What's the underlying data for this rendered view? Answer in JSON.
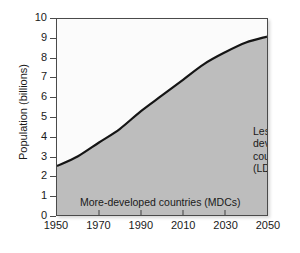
{
  "chart_data": {
    "type": "area",
    "title": "",
    "subtitle": "",
    "xlabel": "",
    "ylabel": "Population (billions)",
    "xlim": [
      1950,
      2050
    ],
    "ylim": [
      0,
      10
    ],
    "grid": false,
    "legend_position": "in-plot annotations",
    "x_ticks": [
      1950,
      1970,
      1990,
      2010,
      2030,
      2050
    ],
    "x_tick_labels": [
      "1950",
      "1970",
      "1990",
      "2010",
      "2030",
      "2050"
    ],
    "y_ticks": [
      0,
      1,
      2,
      3,
      4,
      5,
      6,
      7,
      8,
      9,
      10
    ],
    "y_tick_labels": [
      "0",
      "1",
      "2",
      "3",
      "4",
      "5",
      "6",
      "7",
      "8",
      "9",
      "10"
    ],
    "x": [
      1950,
      1960,
      1970,
      1980,
      1990,
      2000,
      2010,
      2020,
      2030,
      2040,
      2050
    ],
    "series": [
      {
        "name": "Total world population",
        "values": [
          2.5,
          3.0,
          3.7,
          4.4,
          5.3,
          6.1,
          6.9,
          7.7,
          8.3,
          8.8,
          9.1
        ]
      }
    ],
    "annotations": [
      {
        "name": "less-developed-countries",
        "lines": [
          "Less-",
          "developed",
          "countries",
          "(LDCs)"
        ],
        "text": "Less-developed countries (LDCs)",
        "region": "above-curve"
      },
      {
        "name": "more-developed-countries",
        "text": "More-developed countries (MDCs)",
        "region": "below-curve"
      }
    ],
    "colors": {
      "area_fill": "#bdbdbd",
      "upper_fill": "#fbfbfb",
      "curve": "#151515",
      "axis": "#4a4a4a",
      "text": "#1a1a1a"
    }
  },
  "axes": {
    "y_title": "Population (billions)",
    "y_tick_labels": [
      "10",
      "9",
      "8",
      "7",
      "6",
      "5",
      "4",
      "3",
      "2",
      "1",
      "0"
    ],
    "x_tick_labels": [
      "1950",
      "1970",
      "1990",
      "2010",
      "2030",
      "2050"
    ]
  },
  "labels": {
    "ldc_line1": "Less-",
    "ldc_line2": "developed",
    "ldc_line3": "countries",
    "ldc_line4": "(LDCs)",
    "mdc": "More-developed countries (MDCs)"
  }
}
